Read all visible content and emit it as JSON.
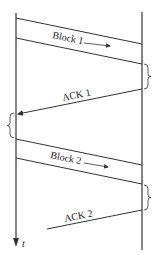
{
  "diagram": {
    "type": "sequence-timing",
    "messages": [
      {
        "label": "Block 1",
        "direction": "left-to-right"
      },
      {
        "label": "ACK 1",
        "direction": "right-to-left"
      },
      {
        "label": "Block 2",
        "direction": "left-to-right"
      },
      {
        "label": "ACK 2",
        "direction": "right-to-left"
      }
    ],
    "time_axis_label": "t",
    "colors": {
      "line": "#333333",
      "background": "#ffffff"
    }
  }
}
